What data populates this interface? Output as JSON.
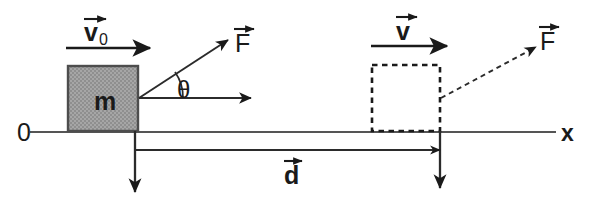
{
  "diagram": {
    "type": "free-body-kinematics-diagram",
    "colors": {
      "stroke": "#1a1a1a",
      "axis": "#555555",
      "block_fill": "#a0a0a0",
      "block_edge": "#4d4d4d",
      "background": "#ffffff"
    },
    "labels": {
      "origin": "0",
      "axis_x": "x",
      "mass": "m",
      "initial_velocity": "v",
      "initial_velocity_subscript": "0",
      "final_velocity": "v",
      "force_initial": "F",
      "force_final": "F",
      "angle": "θ",
      "displacement": "d"
    },
    "elements": {
      "x_axis": {
        "name": "x-axis",
        "x1": 30,
        "y1": 132,
        "x2": 556,
        "y2": 132
      },
      "block": {
        "name": "mass-block",
        "x": 68,
        "y": 66,
        "width": 70,
        "height": 65,
        "fill": "#a0a0a0",
        "label": "m"
      },
      "ghost_block": {
        "name": "ghost-block-dashed",
        "x": 372,
        "y": 65,
        "width": 68,
        "height": 66,
        "style": "dashed"
      },
      "v0_arrow": {
        "name": "initial-velocity-arrow",
        "x1": 66,
        "y1": 48,
        "x2": 150,
        "y2": 48
      },
      "v_arrow": {
        "name": "final-velocity-arrow",
        "x1": 371,
        "y1": 46,
        "x2": 447,
        "y2": 46
      },
      "force_arrow_initial": {
        "name": "force-vector-initial",
        "x1": 139,
        "y1": 98,
        "x2": 228,
        "y2": 40,
        "style": "solid"
      },
      "force_arrow_final": {
        "name": "force-vector-final",
        "x1": 441,
        "y1": 98,
        "x2": 536,
        "y2": 47,
        "style": "dashed"
      },
      "horizontal_ref_arrow": {
        "name": "horizontal-reference-arrow",
        "x1": 139,
        "y1": 98,
        "x2": 251,
        "y2": 98
      },
      "angle_arc": {
        "name": "theta-angle-arc",
        "vertex_x": 139,
        "vertex_y": 98,
        "radius": 44
      },
      "displacement_arrow": {
        "name": "displacement-arrow",
        "x1": 136,
        "y1": 150,
        "x2": 440,
        "y2": 150
      },
      "drop_line_start": {
        "name": "start-position-drop-arrow",
        "x1": 135,
        "y1": 131,
        "x2": 135,
        "y2": 192
      },
      "drop_line_end": {
        "name": "end-position-drop-arrow",
        "x1": 440,
        "y1": 131,
        "x2": 440,
        "y2": 188
      }
    }
  }
}
